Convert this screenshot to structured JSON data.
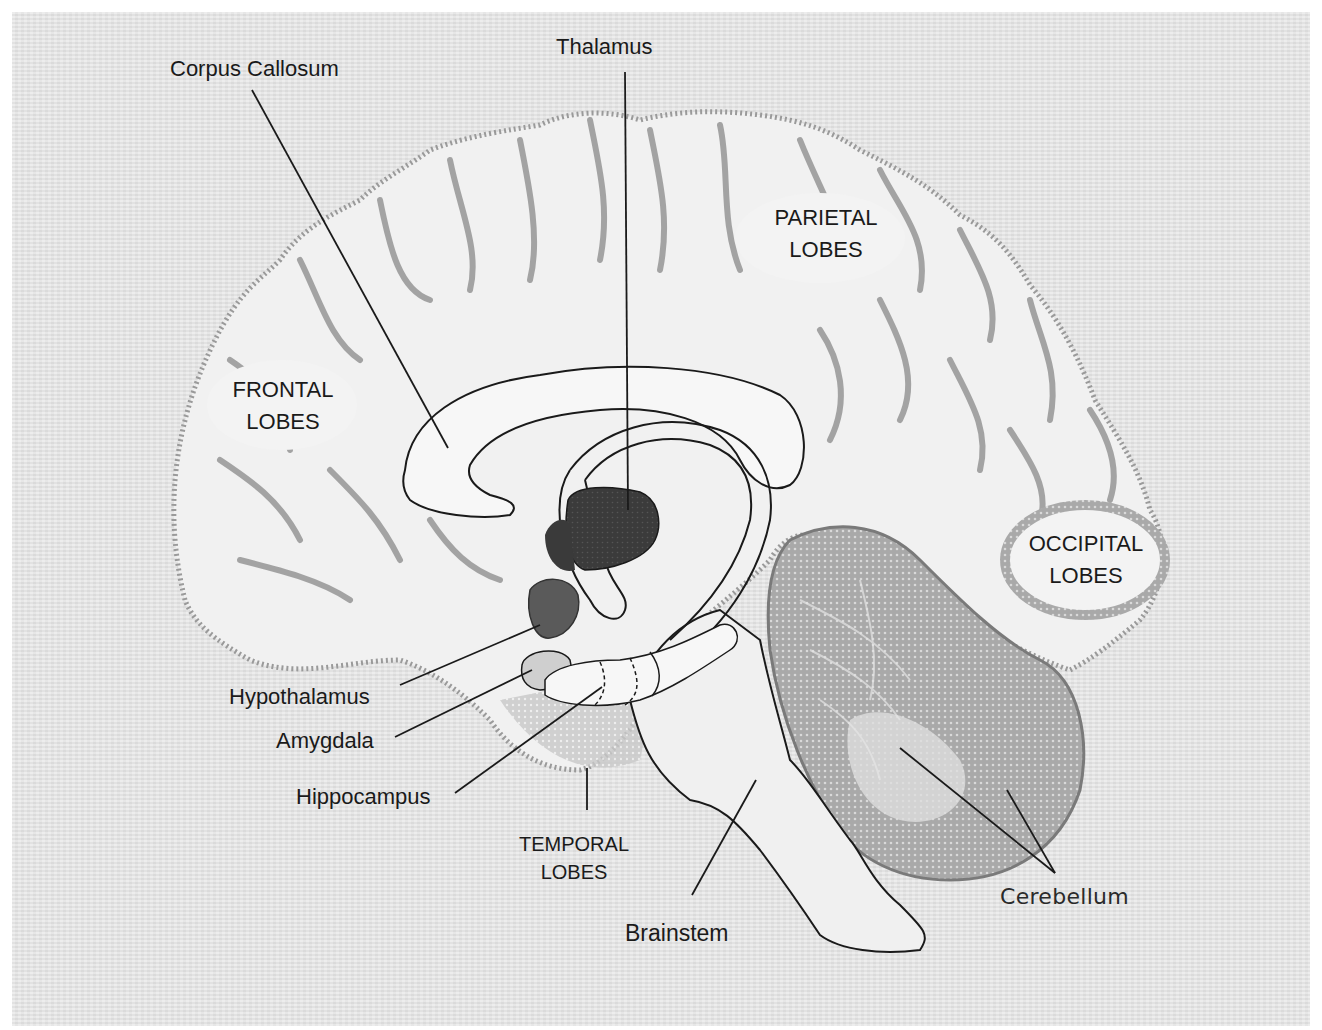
{
  "labels": {
    "corpus_callosum": "Corpus Callosum",
    "thalamus": "Thalamus",
    "parietal_1": "PARIETAL",
    "parietal_2": "LOBES",
    "frontal_1": "FRONTAL",
    "frontal_2": "LOBES",
    "occipital_1": "OCCIPITAL",
    "occipital_2": "LOBES",
    "hypothalamus": "Hypothalamus",
    "amygdala": "Amygdala",
    "hippocampus": "Hippocampus",
    "temporal_1": "TEMPORAL",
    "temporal_2": "LOBES",
    "brainstem": "Brainstem",
    "cerebellum": "Cerebellum"
  },
  "colors": {
    "paper": "#e6e6e6",
    "brain_fill": "#f2f2f2",
    "sulci": "#8a8a8a",
    "outline": "#1a1a1a",
    "thalamus_fill": "#3a3a3a",
    "hypothalamus_fill": "#555555",
    "cerebellum_fill": "#b5b5b5"
  }
}
